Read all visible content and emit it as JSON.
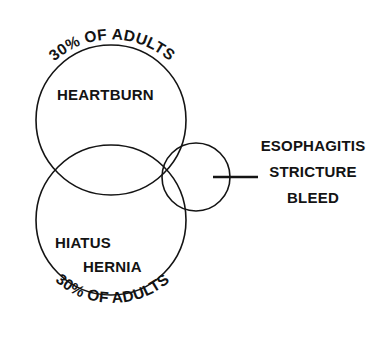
{
  "diagram": {
    "type": "venn",
    "title_visible": false,
    "background_color": "#ffffff",
    "stroke_color": "#141414",
    "text_color": "#131313",
    "sets": [
      {
        "id": "heartburn",
        "label": "HEARTBURN",
        "arc_label": "30% OF ADULTS",
        "arc_label_position": "above",
        "center": {
          "x": 111,
          "y": 120
        },
        "radius": 75
      },
      {
        "id": "hiatus-hernia",
        "label_line_1": "HIATUS",
        "label_line_2": "HERNIA",
        "arc_label": "30% OF ADULTS",
        "arc_label_position": "below",
        "center": {
          "x": 111,
          "y": 220
        },
        "radius": 75
      },
      {
        "id": "complications",
        "label": "",
        "center": {
          "x": 196,
          "y": 177
        },
        "radius": 34
      }
    ],
    "callout": {
      "leader_line": {
        "x1": 213,
        "y1": 177,
        "x2": 258,
        "y2": 177
      },
      "lines": [
        "ESOPHAGITIS",
        "STRICTURE",
        "BLEED"
      ]
    }
  }
}
